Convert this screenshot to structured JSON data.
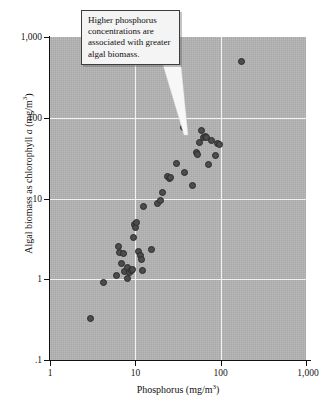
{
  "chart_data": {
    "type": "scatter",
    "title": "",
    "xlabel": "Phosphorus (mg/m3)",
    "xlabel_main": "Phosphorus (mg/m",
    "xlabel_sup": "3",
    "xlabel_tail": ")",
    "ylabel": "Algal biomass as chlorophyll a (mg/m3)",
    "ylabel_lead": "Algal biomass as chlorophyll ",
    "ylabel_ital": "a",
    "ylabel_mid": " (mg/m",
    "ylabel_sup": "3",
    "ylabel_tail": ")",
    "xscale": "log",
    "yscale": "log",
    "xlim": [
      1,
      1000
    ],
    "ylim": [
      0.1,
      1000
    ],
    "grid": true,
    "legend": null,
    "xticks": [
      1,
      10,
      100,
      1000
    ],
    "xticklabels": [
      "1",
      "10",
      "100",
      "1,000"
    ],
    "yticks": [
      0.1,
      1,
      10,
      100,
      1000
    ],
    "yticklabels": [
      ".1",
      "1",
      "10",
      "100",
      "1,000"
    ],
    "marker": {
      "shape": "circle",
      "fill_color": "#4c4c4c",
      "edge_color": "#2b2b2b",
      "size_px": 7
    },
    "plot_background_color": "#b3b3b3",
    "gridline_color": "#f2f2f2",
    "axis_color": "#111111",
    "n_points": 46,
    "points": [
      {
        "x": 3.0,
        "y": 0.33
      },
      {
        "x": 4.2,
        "y": 0.91
      },
      {
        "x": 6.0,
        "y": 1.1
      },
      {
        "x": 6.3,
        "y": 2.55
      },
      {
        "x": 6.5,
        "y": 2.15
      },
      {
        "x": 6.8,
        "y": 1.55
      },
      {
        "x": 7.2,
        "y": 2.1
      },
      {
        "x": 7.4,
        "y": 1.25
      },
      {
        "x": 8.0,
        "y": 1.38
      },
      {
        "x": 8.2,
        "y": 1.02
      },
      {
        "x": 8.6,
        "y": 1.22
      },
      {
        "x": 9.0,
        "y": 1.28
      },
      {
        "x": 9.3,
        "y": 1.32
      },
      {
        "x": 9.6,
        "y": 3.3
      },
      {
        "x": 9.9,
        "y": 4.7
      },
      {
        "x": 10.1,
        "y": 4.4
      },
      {
        "x": 10.4,
        "y": 5.0
      },
      {
        "x": 11.0,
        "y": 2.2
      },
      {
        "x": 11.6,
        "y": 1.95
      },
      {
        "x": 11.9,
        "y": 1.75
      },
      {
        "x": 12.2,
        "y": 1.3
      },
      {
        "x": 12.6,
        "y": 8.0
      },
      {
        "x": 15.5,
        "y": 2.35
      },
      {
        "x": 18.0,
        "y": 8.6
      },
      {
        "x": 19.5,
        "y": 9.4
      },
      {
        "x": 21.0,
        "y": 11.8
      },
      {
        "x": 24.0,
        "y": 18.5
      },
      {
        "x": 25.0,
        "y": 17.8
      },
      {
        "x": 25.5,
        "y": 18.0
      },
      {
        "x": 30.0,
        "y": 27.0
      },
      {
        "x": 37.0,
        "y": 75.0
      },
      {
        "x": 38.0,
        "y": 21.0
      },
      {
        "x": 47.0,
        "y": 14.5
      },
      {
        "x": 52.0,
        "y": 37.0
      },
      {
        "x": 53.0,
        "y": 35.0
      },
      {
        "x": 56.0,
        "y": 50.0
      },
      {
        "x": 60.0,
        "y": 70.0
      },
      {
        "x": 63.0,
        "y": 57.0
      },
      {
        "x": 66.0,
        "y": 58.0
      },
      {
        "x": 68.0,
        "y": 57.0
      },
      {
        "x": 72.0,
        "y": 26.0
      },
      {
        "x": 78.0,
        "y": 52.0
      },
      {
        "x": 86.0,
        "y": 34.0
      },
      {
        "x": 92.0,
        "y": 48.0
      },
      {
        "x": 96.0,
        "y": 47.0
      },
      {
        "x": 175.0,
        "y": 500.0
      }
    ],
    "annotation": {
      "text": "Higher phosphorus concentrations are associated with greater algal biomass.",
      "lines": [
        "Higher phosphorus",
        "concentrations are",
        "associated with greater",
        "algal biomass."
      ],
      "points_to": {
        "x": 37.0,
        "y": 75.0
      },
      "box_fill": "#f4f4f4",
      "box_border": "#3d3d3d"
    }
  }
}
